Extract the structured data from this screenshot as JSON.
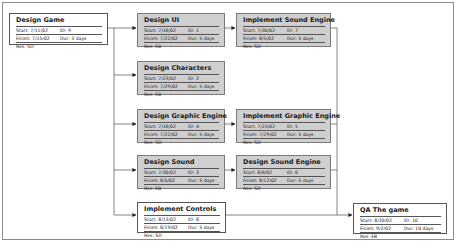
{
  "diagram": {
    "type": "network-diagram",
    "nodes": [
      {
        "key": "design-game",
        "title": "Design Game",
        "start": "Start: 7/11/02",
        "id": "ID: 9",
        "finish": "Finish: 7/15/02",
        "dur": "Dur: 3 days",
        "res": "Res: SD",
        "critical": false
      },
      {
        "key": "design-ui",
        "title": "Design UI",
        "start": "Start: 7/16/02",
        "id": "ID: 1",
        "finish": "Finish: 7/22/02",
        "dur": "Dur: 5 days",
        "res": "Res: EB",
        "critical": true
      },
      {
        "key": "implement-sound-engine",
        "title": "Implement Sound Engine",
        "start": "Start: 7/30/02",
        "id": "ID: 7",
        "finish": "Finish: 8/5/02",
        "dur": "Dur: 5 days",
        "res": "Res: SD",
        "critical": true
      },
      {
        "key": "design-characters",
        "title": "Design Characters",
        "start": "Start: 7/23/02",
        "id": "ID: 2",
        "finish": "Finish: 7/29/02",
        "dur": "Dur: 5 days",
        "res": "Res: EB",
        "critical": true
      },
      {
        "key": "design-graphic-engine",
        "title": "Design Graphic Engine",
        "start": "Start: 7/16/02",
        "id": "ID: 4",
        "finish": "Finish: 7/22/02",
        "dur": "Dur: 5 days",
        "res": "Res: SD",
        "critical": true
      },
      {
        "key": "implement-graphic-engine",
        "title": "Implement Graphic Engine",
        "start": "Start: 7/23/02",
        "id": "ID: 5",
        "finish": "Finish: 7/29/02",
        "dur": "Dur: 5 days",
        "res": "Res: SD",
        "critical": true
      },
      {
        "key": "design-sound",
        "title": "Design Sound",
        "start": "Start: 7/30/02",
        "id": "ID: 3",
        "finish": "Finish: 8/5/02",
        "dur": "Dur: 5 days",
        "res": "Res: EB",
        "critical": true
      },
      {
        "key": "design-sound-engine",
        "title": "Design Sound Engine",
        "start": "Start: 8/6/02",
        "id": "ID: 6",
        "finish": "Finish: 8/12/02",
        "dur": "Dur: 5 days",
        "res": "Res: SD",
        "critical": true
      },
      {
        "key": "implement-controls",
        "title": "Implement Controls",
        "start": "Start: 8/13/02",
        "id": "ID: 8",
        "finish": "Finish: 8/19/02",
        "dur": "Dur: 5 days",
        "res": "Res: SD",
        "critical": false
      },
      {
        "key": "qa-the-game",
        "title": "QA The game",
        "start": "Start: 8/20/02",
        "id": "ID: 10",
        "finish": "Finish: 9/2/02",
        "dur": "Dur: 10 days",
        "res": "Res: EB",
        "critical": false
      }
    ],
    "edges": [
      [
        "design-game",
        "design-ui"
      ],
      [
        "design-game",
        "design-characters"
      ],
      [
        "design-game",
        "design-graphic-engine"
      ],
      [
        "design-game",
        "design-sound"
      ],
      [
        "design-game",
        "implement-controls"
      ],
      [
        "design-ui",
        "implement-sound-engine"
      ],
      [
        "design-graphic-engine",
        "implement-graphic-engine"
      ],
      [
        "design-sound",
        "design-sound-engine"
      ],
      [
        "implement-sound-engine",
        "qa-the-game"
      ],
      [
        "implement-graphic-engine",
        "qa-the-game"
      ],
      [
        "design-sound-engine",
        "qa-the-game"
      ],
      [
        "implement-controls",
        "qa-the-game"
      ]
    ]
  }
}
